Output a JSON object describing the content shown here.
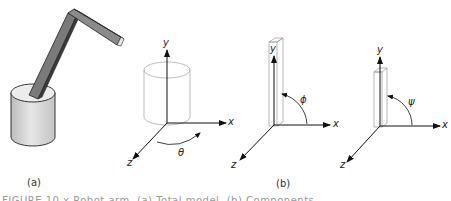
{
  "figure": {
    "panels": [
      {
        "id": "a",
        "label": "(a)",
        "description": "robot arm on cylindrical base"
      },
      {
        "id": "b",
        "label": "(b)",
        "description": "three joint coordinate frames"
      }
    ],
    "diagrams": [
      {
        "name": "base-rotation",
        "axes": {
          "x": "x",
          "y": "y",
          "z": "z"
        },
        "angle": "θ"
      },
      {
        "name": "lower-arm-rotation",
        "axes": {
          "x": "x",
          "y": "y",
          "z": "z"
        },
        "angle": "ϕ"
      },
      {
        "name": "upper-arm-rotation",
        "axes": {
          "x": "x",
          "y": "y",
          "z": "z"
        },
        "angle": "ψ"
      }
    ],
    "caption": "FIGURE 10.x  Robot arm. (a) Total model. (b) Components."
  },
  "colors": {
    "line": "#222222",
    "cylinder_fill": "#d8d8d8",
    "arm_dark": "#444444",
    "arm_mid": "#777777",
    "faint": "#b0b0b0"
  }
}
